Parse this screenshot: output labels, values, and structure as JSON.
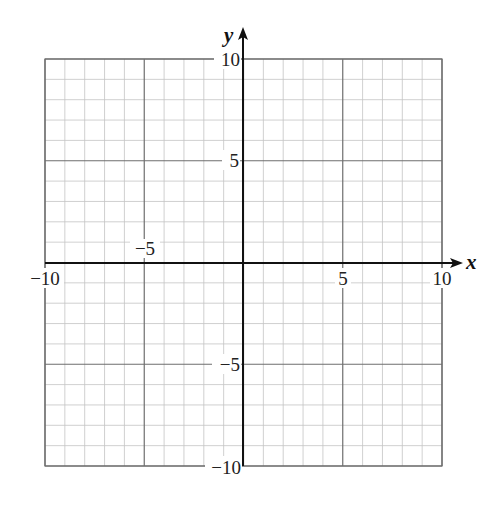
{
  "chart_data": {
    "type": "scatter",
    "title": "",
    "xlabel": "x",
    "ylabel": "y",
    "xlim": [
      -10,
      10
    ],
    "ylim": [
      -10,
      10
    ],
    "grid": true,
    "minor_grid_step": 1,
    "major_grid_step": 5,
    "series": [],
    "x_tick_labels": [
      "-10",
      "-5",
      "5",
      "10"
    ],
    "y_tick_labels": [
      "10",
      "5",
      "-5",
      "-10"
    ],
    "legend": null
  },
  "axes": {
    "x_label": "x",
    "y_label": "y",
    "ticks": {
      "x_neg10": "−10",
      "x_neg5": "−5",
      "x_pos5": "5",
      "x_pos10": "10",
      "y_pos10": "10",
      "y_pos5": "5",
      "y_neg5": "−5",
      "y_neg10": "−10"
    }
  },
  "colors": {
    "minor_grid": "#c4c4c4",
    "major_grid": "#6e6e6e",
    "axis": "#111111",
    "background": "#ffffff"
  }
}
